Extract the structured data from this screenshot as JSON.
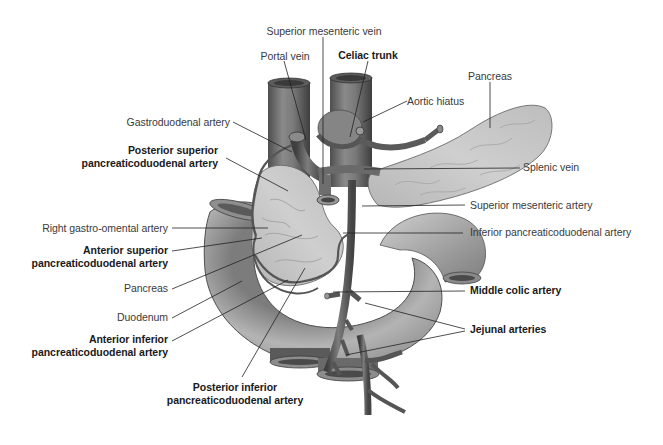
{
  "diagram": {
    "colors": {
      "background": "#ffffff",
      "vessel": "#6e6e6e",
      "vessel_dark": "#4a4a4a",
      "vessel_light": "#9a9a9a",
      "duodenum": "#a8a8a8",
      "pancreas": "#c9c9c9",
      "leader_line": "#222222",
      "label_text": "#3a3a3a",
      "label_text_bold": "#1a1a1a"
    },
    "labels_top": {
      "superior_mesenteric_vein": "Superior mesenteric vein",
      "portal_vein": "Portal vein",
      "celiac_trunk": "Celiac trunk",
      "pancreas_tail": "Pancreas",
      "aortic_hiatus": "Aortic hiatus"
    },
    "labels_left": {
      "gastroduodenal_artery": "Gastroduodenal artery",
      "posterior_superior_line1": "Posterior superior",
      "posterior_superior_line2": "pancreaticoduodenal artery",
      "right_gastro_omental_artery": "Right gastro-omental artery",
      "anterior_superior_line1": "Anterior superior",
      "anterior_superior_line2": "pancreaticoduodenal artery",
      "pancreas_head": "Pancreas",
      "duodenum": "Duodenum",
      "anterior_inferior_line1": "Anterior inferior",
      "anterior_inferior_line2": "pancreaticoduodenal artery"
    },
    "labels_bottom": {
      "posterior_inferior_line1": "Posterior inferior",
      "posterior_inferior_line2": "pancreaticoduodenal artery"
    },
    "labels_right": {
      "splenic_vein": "Splenic vein",
      "superior_mesenteric_artery": "Superior mesenteric artery",
      "inferior_pancreaticoduodenal_artery": "Inferior pancreaticoduodenal artery",
      "middle_colic_artery": "Middle colic artery",
      "jejunal_arteries": "Jejunal arteries"
    }
  }
}
